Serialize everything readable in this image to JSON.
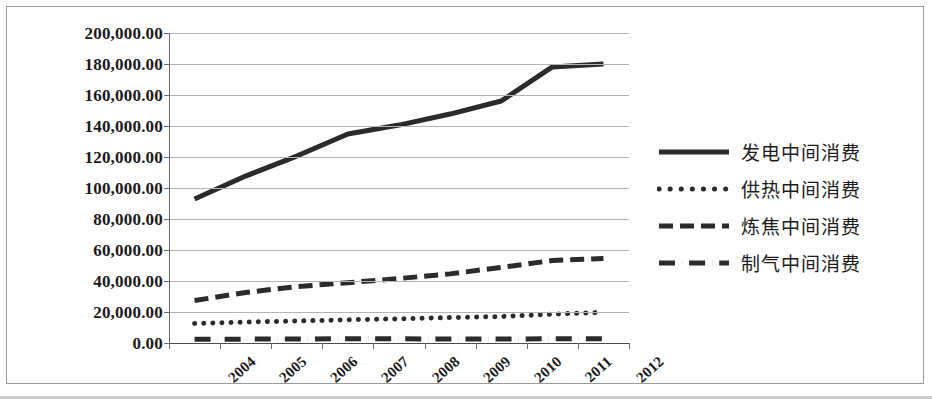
{
  "chart_data": {
    "type": "line",
    "title": "",
    "xlabel": "",
    "ylabel": "",
    "categories": [
      "2004",
      "2005",
      "2006",
      "2007",
      "2008",
      "2009",
      "2010",
      "2011",
      "2012"
    ],
    "ylim": [
      0,
      200000
    ],
    "y_ticks": [
      "0.00",
      "20,000.00",
      "40,000.00",
      "60,000.00",
      "80,000.00",
      "100,000.00",
      "120,000.00",
      "140,000.00",
      "160,000.00",
      "180,000.00",
      "200,000.00"
    ],
    "y_tick_values": [
      0,
      20000,
      40000,
      60000,
      80000,
      100000,
      120000,
      140000,
      160000,
      180000,
      200000
    ],
    "grid": true,
    "legend_position": "right",
    "series": [
      {
        "name": "发电中间消费",
        "style": "solid",
        "color": "#2b2b2b",
        "values": [
          92900,
          107700,
          120600,
          134800,
          140600,
          147700,
          156100,
          178100,
          180000
        ]
      },
      {
        "name": "供热中间消费",
        "style": "dotted",
        "color": "#2b2b2b",
        "values": [
          12600,
          13500,
          14200,
          15000,
          15600,
          16400,
          17100,
          18600,
          19800
        ]
      },
      {
        "name": "炼焦中间消费",
        "style": "dashed",
        "color": "#2b2b2b",
        "values": [
          27400,
          32600,
          36400,
          38900,
          41600,
          44600,
          48800,
          53200,
          54500
        ]
      },
      {
        "name": "制气中间消费",
        "style": "dashdot",
        "color": "#2b2b2b",
        "values": [
          2400,
          2500,
          2600,
          2700,
          2700,
          2600,
          2600,
          2700,
          2700
        ]
      }
    ]
  }
}
